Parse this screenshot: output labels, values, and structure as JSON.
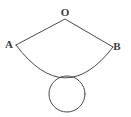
{
  "figure": {
    "background_color": "#ffffff",
    "stroke_color": "#4a4a4a",
    "label_color": "#3c3c3c",
    "stroke_width": 1,
    "labels": {
      "apex": "O",
      "left": "A",
      "right": "B"
    },
    "label_positions": {
      "apex": {
        "x": 65,
        "y": 16
      },
      "left": {
        "x": 9,
        "y": 48
      },
      "right": {
        "x": 117,
        "y": 50
      }
    },
    "points": {
      "O": {
        "x": 65,
        "y": 19
      },
      "A": {
        "x": 16,
        "y": 45
      },
      "B": {
        "x": 113,
        "y": 47
      }
    },
    "sector": {
      "apex": {
        "x": 65,
        "y": 19
      },
      "radius": 56,
      "arc_sag_y": 77,
      "path": "M 16 45 L 65 19 L 113 47 A 56 56 0 0 1 16 45 Z"
    },
    "circle": {
      "center": {
        "x": 67,
        "y": 94
      },
      "radius": 18,
      "tangent_to": "arc AB"
    }
  }
}
